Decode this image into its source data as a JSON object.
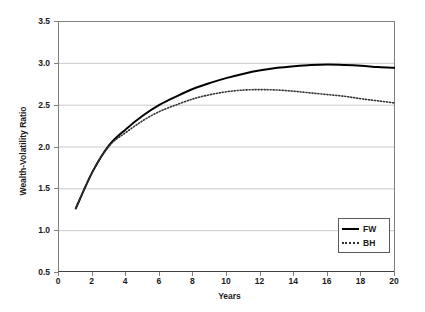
{
  "chart_data": {
    "type": "line",
    "title": "",
    "xlabel": "Years",
    "ylabel": "Wealth-Volatility Ratio",
    "xlim": [
      0,
      20
    ],
    "ylim": [
      0.5,
      3.5
    ],
    "xticks": [
      0,
      2,
      4,
      6,
      8,
      10,
      12,
      14,
      16,
      18,
      20
    ],
    "xtick_labels": [
      "0",
      "2",
      "4",
      "6",
      "8",
      "10",
      "12",
      "14",
      "16",
      "18",
      "20"
    ],
    "yticks": [
      0.5,
      1.0,
      1.5,
      2.0,
      2.5,
      3.0,
      3.5
    ],
    "ytick_labels": [
      "0.5",
      "1.0",
      "1.5",
      "2.0",
      "2.5",
      "3.0",
      "3.5"
    ],
    "grid": "horizontal",
    "legend_position": "lower-right",
    "x": [
      1,
      2,
      3,
      4,
      5,
      6,
      7,
      8,
      9,
      10,
      11,
      12,
      13,
      14,
      15,
      16,
      17,
      18,
      19,
      20
    ],
    "series": [
      {
        "name": "FW",
        "style": "solid",
        "color": "#000000",
        "values": [
          1.26,
          1.7,
          2.02,
          2.21,
          2.37,
          2.5,
          2.6,
          2.69,
          2.76,
          2.82,
          2.87,
          2.91,
          2.94,
          2.96,
          2.975,
          2.98,
          2.975,
          2.965,
          2.95,
          2.94
        ]
      },
      {
        "name": "BH",
        "style": "dotted",
        "color": "#333333",
        "values": [
          1.26,
          1.7,
          2.01,
          2.17,
          2.31,
          2.42,
          2.5,
          2.57,
          2.62,
          2.655,
          2.675,
          2.68,
          2.675,
          2.66,
          2.64,
          2.62,
          2.6,
          2.57,
          2.545,
          2.52
        ]
      }
    ]
  },
  "legend": {
    "entries": [
      {
        "label": "FW",
        "style": "solid"
      },
      {
        "label": "BH",
        "style": "dotted"
      }
    ]
  }
}
